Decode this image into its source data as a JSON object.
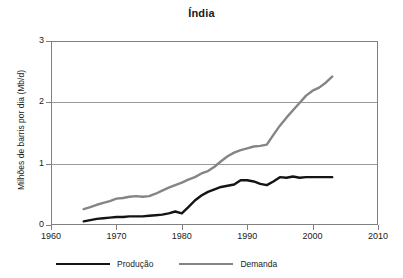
{
  "chart_data": {
    "type": "line",
    "title": "Índia",
    "xlabel": "",
    "ylabel": "Milhões de barris por dia (Mb/d)",
    "xlim": [
      1960,
      2010
    ],
    "ylim": [
      0,
      3
    ],
    "xticks": [
      "1960",
      "1970",
      "1980",
      "1990",
      "2000",
      "2010"
    ],
    "yticks": [
      "0",
      "1",
      "2",
      "3"
    ],
    "grid": "horizontal",
    "legend_position": "bottom",
    "colors": {
      "producao": "#141414",
      "demanda": "#858585",
      "gridline": "#9a9a9a",
      "axis": "#808080"
    },
    "x": [
      1965,
      1966,
      1967,
      1968,
      1969,
      1970,
      1971,
      1972,
      1973,
      1974,
      1975,
      1976,
      1977,
      1978,
      1979,
      1980,
      1981,
      1982,
      1983,
      1984,
      1985,
      1986,
      1987,
      1988,
      1989,
      1990,
      1991,
      1992,
      1993,
      1994,
      1995,
      1996,
      1997,
      1998,
      1999,
      2000,
      2001,
      2002,
      2003
    ],
    "series": [
      {
        "name": "Produção",
        "color": "#141414",
        "values": [
          0.06,
          0.08,
          0.1,
          0.11,
          0.12,
          0.13,
          0.13,
          0.14,
          0.14,
          0.14,
          0.15,
          0.16,
          0.17,
          0.19,
          0.22,
          0.19,
          0.29,
          0.4,
          0.48,
          0.54,
          0.58,
          0.62,
          0.64,
          0.66,
          0.73,
          0.73,
          0.71,
          0.67,
          0.65,
          0.71,
          0.78,
          0.77,
          0.79,
          0.77,
          0.78,
          0.78,
          0.78,
          0.78,
          0.78
        ]
      },
      {
        "name": "Demanda",
        "color": "#858585",
        "values": [
          0.26,
          0.29,
          0.33,
          0.36,
          0.39,
          0.43,
          0.44,
          0.46,
          0.47,
          0.46,
          0.47,
          0.51,
          0.56,
          0.61,
          0.65,
          0.69,
          0.74,
          0.78,
          0.84,
          0.88,
          0.95,
          1.04,
          1.12,
          1.18,
          1.22,
          1.25,
          1.28,
          1.29,
          1.31,
          1.47,
          1.62,
          1.75,
          1.87,
          1.99,
          2.11,
          2.19,
          2.24,
          2.32,
          2.42
        ]
      }
    ]
  },
  "legend": {
    "producao_label": "Produção",
    "demanda_label": "Demanda"
  }
}
